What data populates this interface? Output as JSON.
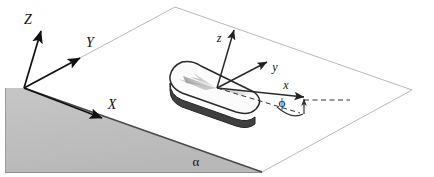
{
  "figure": {
    "background_color": "#ffffff",
    "border_color": "#b0b0b0",
    "width": 434,
    "height": 177
  },
  "colors": {
    "plane_outline": "#b9b9b9",
    "incline_fill": "#bfbfbf",
    "incline_outline": "#6f6f6f",
    "axis_stroke": "#111111",
    "object_top_fill": "#fbfbfb",
    "object_top_stroke": "#2a2a2a",
    "object_side_fill": "#4a4a4a",
    "shadow_fill": "#9a9a9a",
    "dashed_stroke": "#333333",
    "label_color": "#111111"
  },
  "global_frame": {
    "name": "global-coordinate-frame",
    "origin_label": "",
    "axes": [
      {
        "id": "Z",
        "label": "Z",
        "label_x": 32,
        "label_y": 22,
        "tip_x": 41,
        "tip_y": 30
      },
      {
        "id": "Y",
        "label": "Y",
        "label_x": 90,
        "label_y": 45,
        "tip_x": 78,
        "tip_y": 60
      },
      {
        "id": "X",
        "label": "X",
        "label_x": 111,
        "label_y": 107,
        "tip_x": 100,
        "tip_y": 117
      }
    ]
  },
  "local_frame": {
    "name": "body-coordinate-frame",
    "axes": [
      {
        "id": "z",
        "label": "z",
        "label_x": 218,
        "label_y": 40,
        "tip_x": 234,
        "tip_y": 28
      },
      {
        "id": "y",
        "label": "y",
        "label_x": 273,
        "label_y": 70,
        "tip_x": 265,
        "tip_y": 61
      },
      {
        "id": "x",
        "label": "x",
        "label_x": 284,
        "label_y": 90,
        "tip_x": 302,
        "tip_y": 96
      }
    ]
  },
  "angles": [
    {
      "id": "alpha",
      "symbol": "α",
      "meaning": "inclination angle of the plane",
      "label_x": 196,
      "label_y": 164
    },
    {
      "id": "phi",
      "symbol": "ϕ",
      "meaning": "azimuth angle of the body x-axis",
      "label_x": 282,
      "label_y": 106
    }
  ],
  "object": {
    "name": "rounded-puck",
    "description": "rounded rectangular slab resting on the inclined plane",
    "center_x": 217,
    "center_y": 87
  },
  "geometry": {
    "plane_polygon": "175,7 412,90 262,172 24,88",
    "incline_polygon": "24,88 262,172 5,172 5,88",
    "incline_ridge": "24,88 262,172",
    "global_origin": {
      "x": 24,
      "y": 88
    },
    "local_origin": {
      "x": 217,
      "y": 87
    }
  }
}
